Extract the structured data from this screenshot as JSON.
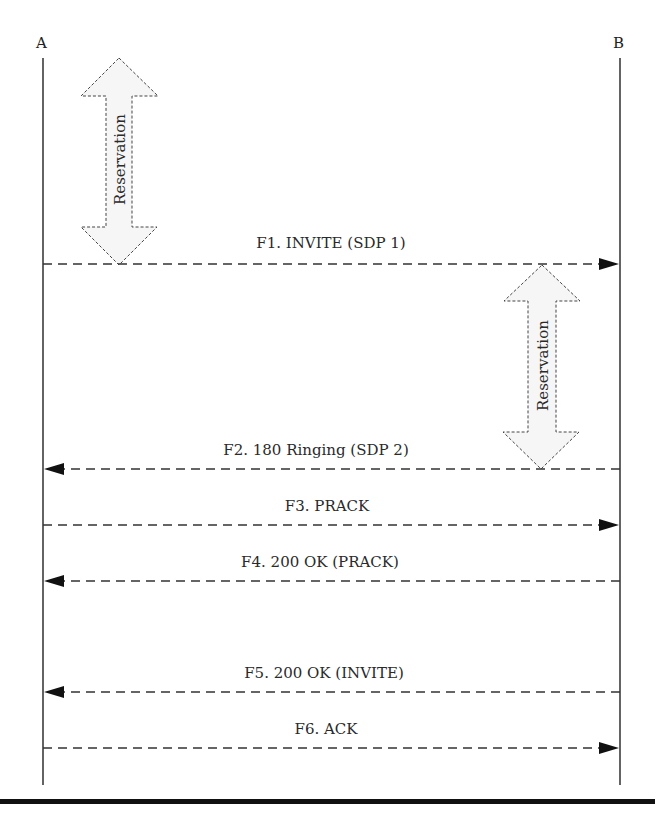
{
  "diagram": {
    "type": "sequence",
    "actors": [
      {
        "id": "A",
        "label": "A",
        "x": 43
      },
      {
        "id": "B",
        "label": "B",
        "x": 620
      }
    ],
    "reservations": [
      {
        "label": "Reservation",
        "side": "A",
        "cx": 119,
        "top": 57,
        "bottom": 265
      },
      {
        "label": "Reservation",
        "side": "B",
        "cx": 542,
        "top": 265,
        "bottom": 469
      }
    ],
    "messages": [
      {
        "label": "F1. INVITE (SDP 1)",
        "from": "A",
        "to": "B",
        "y": 264
      },
      {
        "label": "F2. 180 Ringing (SDP 2)",
        "from": "B",
        "to": "A",
        "y": 469
      },
      {
        "label": "F3. PRACK",
        "from": "A",
        "to": "B",
        "y": 525
      },
      {
        "label": "F4. 200 OK (PRACK)",
        "from": "B",
        "to": "A",
        "y": 581
      },
      {
        "label": "F5. 200 OK (INVITE)",
        "from": "B",
        "to": "A",
        "y": 692
      },
      {
        "label": "F6. ACK",
        "from": "A",
        "to": "B",
        "y": 748
      }
    ]
  }
}
